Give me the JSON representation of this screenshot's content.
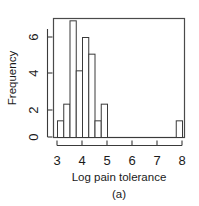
{
  "chart_data": {
    "type": "bar",
    "subtype": "histogram",
    "title": "",
    "xlabel": "Log pain tolerance",
    "ylabel": "Frequency",
    "panel_label": "(a)",
    "bin_width": 0.25,
    "bin_starts": [
      3.0,
      3.25,
      3.5,
      3.75,
      4.0,
      4.25,
      4.5,
      4.75,
      5.0,
      5.25,
      5.5,
      5.75,
      6.0,
      6.25,
      6.5,
      6.75,
      7.0,
      7.25,
      7.5,
      7.75
    ],
    "bin_labels": [
      "3.00-3.25",
      "3.25-3.50",
      "3.50-3.75",
      "3.75-4.00",
      "4.00-4.25",
      "4.25-4.50",
      "4.50-4.75",
      "4.75-5.00",
      "5.00-5.25",
      "5.25-5.50",
      "5.50-5.75",
      "5.75-6.00",
      "6.00-6.25",
      "6.25-6.50",
      "6.50-6.75",
      "6.75-7.00",
      "7.00-7.25",
      "7.25-7.50",
      "7.50-7.75",
      "7.75-8.00"
    ],
    "values": [
      1,
      2,
      7,
      4,
      6,
      5,
      1,
      2,
      0,
      0,
      0,
      0,
      0,
      0,
      0,
      0,
      0,
      0,
      0,
      1
    ],
    "xticks": [
      3,
      4,
      5,
      6,
      7,
      8
    ],
    "xtick_labels": [
      "3",
      "4",
      "5",
      "6",
      "7",
      "8"
    ],
    "yticks": [
      0,
      2,
      4,
      6
    ],
    "ytick_labels": [
      "0",
      "2",
      "4",
      "6"
    ],
    "xlim": [
      2.85,
      8.15
    ],
    "ylim": [
      0,
      7.35
    ],
    "grid": false,
    "legend": null,
    "bar_fill": "#ffffff",
    "bar_stroke": "#3a3a3a",
    "background": "#ffffff"
  },
  "axes": {
    "y_title": "Frequency",
    "x_title": "Log pain tolerance",
    "caption": "(a)"
  },
  "ytick_text": {
    "t0": "0",
    "t1": "2",
    "t2": "4",
    "t3": "6"
  },
  "xtick_text": {
    "t0": "3",
    "t1": "4",
    "t2": "5",
    "t3": "6",
    "t4": "7",
    "t5": "8"
  }
}
